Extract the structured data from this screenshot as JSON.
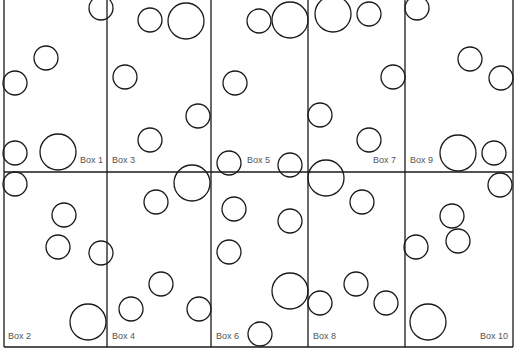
{
  "diagram": {
    "title": "",
    "line_color": "#1a1a1a",
    "label_color": "#555555",
    "grid": {
      "vertical_lines_x": [
        4,
        107,
        211,
        308,
        405,
        513
      ],
      "horizontal_lines_y": [
        172,
        347
      ],
      "top_y": 0
    },
    "boxes": [
      {
        "id": 1,
        "label": "Box 1",
        "label_x": 80,
        "label_y": 163
      },
      {
        "id": 3,
        "label": "Box 3",
        "label_x": 112,
        "label_y": 163
      },
      {
        "id": 5,
        "label": "Box 5",
        "label_x": 247,
        "label_y": 163
      },
      {
        "id": 7,
        "label": "Box 7",
        "label_x": 373,
        "label_y": 163
      },
      {
        "id": 9,
        "label": "Box 9",
        "label_x": 410,
        "label_y": 163
      },
      {
        "id": 2,
        "label": "Box 2",
        "label_x": 8,
        "label_y": 339
      },
      {
        "id": 4,
        "label": "Box 4",
        "label_x": 112,
        "label_y": 339
      },
      {
        "id": 6,
        "label": "Box 6",
        "label_x": 216,
        "label_y": 339
      },
      {
        "id": 8,
        "label": "Box 8",
        "label_x": 313,
        "label_y": 339
      },
      {
        "id": 10,
        "label": "Box 10",
        "label_x": 480,
        "label_y": 339
      }
    ],
    "circles": [
      {
        "cx": 101,
        "cy": 8,
        "r": 12
      },
      {
        "cx": 46,
        "cy": 58,
        "r": 12
      },
      {
        "cx": 15,
        "cy": 83,
        "r": 12
      },
      {
        "cx": 15,
        "cy": 153,
        "r": 12
      },
      {
        "cx": 58,
        "cy": 152,
        "r": 18
      },
      {
        "cx": 150,
        "cy": 20,
        "r": 12
      },
      {
        "cx": 186,
        "cy": 21,
        "r": 18
      },
      {
        "cx": 125,
        "cy": 77,
        "r": 12
      },
      {
        "cx": 198,
        "cy": 116,
        "r": 12
      },
      {
        "cx": 150,
        "cy": 140,
        "r": 12
      },
      {
        "cx": 259,
        "cy": 21,
        "r": 12
      },
      {
        "cx": 290,
        "cy": 20,
        "r": 18
      },
      {
        "cx": 235,
        "cy": 83,
        "r": 12
      },
      {
        "cx": 229,
        "cy": 163,
        "r": 12
      },
      {
        "cx": 290,
        "cy": 165,
        "r": 12
      },
      {
        "cx": 333,
        "cy": 14,
        "r": 18
      },
      {
        "cx": 369,
        "cy": 14,
        "r": 12
      },
      {
        "cx": 393,
        "cy": 77,
        "r": 12
      },
      {
        "cx": 320,
        "cy": 115,
        "r": 12
      },
      {
        "cx": 369,
        "cy": 140,
        "r": 12
      },
      {
        "cx": 326,
        "cy": 178,
        "r": 18
      },
      {
        "cx": 417,
        "cy": 8,
        "r": 12
      },
      {
        "cx": 470,
        "cy": 59,
        "r": 12
      },
      {
        "cx": 501,
        "cy": 78,
        "r": 12
      },
      {
        "cx": 458,
        "cy": 153,
        "r": 18
      },
      {
        "cx": 494,
        "cy": 153,
        "r": 12
      },
      {
        "cx": 15,
        "cy": 184,
        "r": 12
      },
      {
        "cx": 64,
        "cy": 215,
        "r": 12
      },
      {
        "cx": 58,
        "cy": 247,
        "r": 12
      },
      {
        "cx": 101,
        "cy": 253,
        "r": 12
      },
      {
        "cx": 88,
        "cy": 322,
        "r": 18
      },
      {
        "cx": 192,
        "cy": 183,
        "r": 18
      },
      {
        "cx": 156,
        "cy": 202,
        "r": 12
      },
      {
        "cx": 161,
        "cy": 284,
        "r": 12
      },
      {
        "cx": 131,
        "cy": 309,
        "r": 12
      },
      {
        "cx": 199,
        "cy": 309,
        "r": 12
      },
      {
        "cx": 234,
        "cy": 209,
        "r": 12
      },
      {
        "cx": 290,
        "cy": 221,
        "r": 12
      },
      {
        "cx": 229,
        "cy": 252,
        "r": 12
      },
      {
        "cx": 290,
        "cy": 291,
        "r": 18
      },
      {
        "cx": 260,
        "cy": 334,
        "r": 12
      },
      {
        "cx": 362,
        "cy": 202,
        "r": 12
      },
      {
        "cx": 356,
        "cy": 284,
        "r": 12
      },
      {
        "cx": 320,
        "cy": 303,
        "r": 12
      },
      {
        "cx": 386,
        "cy": 303,
        "r": 12
      },
      {
        "cx": 500,
        "cy": 185,
        "r": 12
      },
      {
        "cx": 452,
        "cy": 216,
        "r": 12
      },
      {
        "cx": 458,
        "cy": 241,
        "r": 12
      },
      {
        "cx": 416,
        "cy": 247,
        "r": 12
      },
      {
        "cx": 428,
        "cy": 322,
        "r": 18
      }
    ]
  }
}
